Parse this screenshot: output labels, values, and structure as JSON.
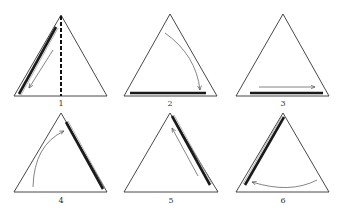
{
  "figure": {
    "colors": {
      "outline": "#333333",
      "bar": "#1a1a1a",
      "arrow": "#666666",
      "background": "#ffffff"
    },
    "panels": [
      {
        "label": "1",
        "note": "dashed median, thick bar on left edge, arrow down-left"
      },
      {
        "label": "2",
        "note": "curved arrow from apex to base, thick bar on base"
      },
      {
        "label": "3",
        "note": "straight arrow right, thick bar on base"
      },
      {
        "label": "4",
        "note": "curved arrow up, thick bar on right edge"
      },
      {
        "label": "5",
        "note": "straight arrow up along right edge, thick bar on right edge"
      },
      {
        "label": "6",
        "note": "curved arrow left, thick bar on left edge"
      }
    ]
  }
}
